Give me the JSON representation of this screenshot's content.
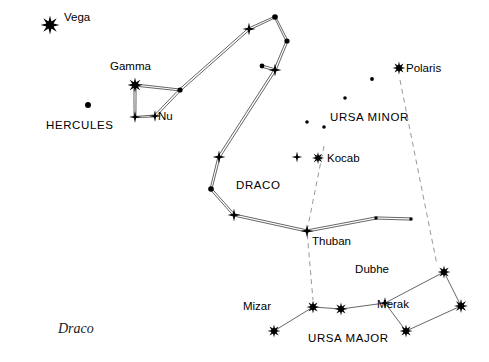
{
  "figure": {
    "caption": "Draco",
    "background_color": "#ffffff",
    "line_color": "#555555",
    "star_color": "#000000",
    "dashed_color": "#999999",
    "width": 489,
    "height": 362
  },
  "labels": [
    {
      "name": "vega-label",
      "text": "Vega",
      "x": 64,
      "y": 20,
      "anchor": "start",
      "kind": "star"
    },
    {
      "name": "gamma-label",
      "text": "Gamma",
      "x": 110,
      "y": 69,
      "anchor": "start",
      "kind": "star"
    },
    {
      "name": "nu-label",
      "text": "Nu",
      "x": 158,
      "y": 119,
      "anchor": "start",
      "kind": "star"
    },
    {
      "name": "hercules-label",
      "text": "HERCULES",
      "x": 46,
      "y": 128,
      "anchor": "start",
      "kind": "constellation"
    },
    {
      "name": "polaris-label",
      "text": "Polaris",
      "x": 406,
      "y": 71,
      "anchor": "start",
      "kind": "star"
    },
    {
      "name": "ursa-minor-label",
      "text": "URSA  MINOR",
      "x": 330,
      "y": 120,
      "anchor": "start",
      "kind": "constellation"
    },
    {
      "name": "kocab-label",
      "text": "Kocab",
      "x": 327,
      "y": 161,
      "anchor": "start",
      "kind": "star"
    },
    {
      "name": "draco-label",
      "text": "DRACO",
      "x": 236,
      "y": 188,
      "anchor": "start",
      "kind": "constellation"
    },
    {
      "name": "thuban-label",
      "text": "Thuban",
      "x": 312,
      "y": 244,
      "anchor": "start",
      "kind": "star"
    },
    {
      "name": "dubhe-label",
      "text": "Dubhe",
      "x": 389,
      "y": 272,
      "anchor": "end",
      "kind": "star"
    },
    {
      "name": "merak-label",
      "text": "Merak",
      "x": 409,
      "y": 307,
      "anchor": "end",
      "kind": "star"
    },
    {
      "name": "mizar-label",
      "text": "Mizar",
      "x": 271,
      "y": 309,
      "anchor": "end",
      "kind": "star"
    },
    {
      "name": "ursa-major-label",
      "text": "URSA  MAJOR",
      "x": 308,
      "y": 341,
      "anchor": "start",
      "kind": "constellation"
    }
  ],
  "chart_data": {
    "type": "scatter",
    "title": "Draco",
    "xlabel": "",
    "ylabel": "",
    "xlim": [
      0,
      489
    ],
    "ylim": [
      0,
      362
    ],
    "grid": false,
    "legend": "none",
    "stars": [
      {
        "id": "vega",
        "label": "Vega",
        "x": 50,
        "y": 25,
        "glyph": "burst8",
        "size": 9.5
      },
      {
        "id": "gamma",
        "label": "Gamma",
        "x": 135,
        "y": 85,
        "glyph": "burst8",
        "size": 7.5
      },
      {
        "id": "d-head-e",
        "label": "",
        "x": 180,
        "y": 90,
        "glyph": "dot",
        "size": 2.6
      },
      {
        "id": "nu",
        "label": "Nu",
        "x": 155,
        "y": 116,
        "glyph": "cross",
        "size": 6.0
      },
      {
        "id": "d-head-s",
        "label": "",
        "x": 135,
        "y": 117,
        "glyph": "cross",
        "size": 6.0
      },
      {
        "id": "herc-dot",
        "label": "HERCULES",
        "x": 88,
        "y": 105,
        "glyph": "dot",
        "size": 3.0
      },
      {
        "id": "d-b1",
        "label": "",
        "x": 249,
        "y": 29,
        "glyph": "cross",
        "size": 6.5
      },
      {
        "id": "d-b2",
        "label": "",
        "x": 275,
        "y": 17,
        "glyph": "dot",
        "size": 2.8
      },
      {
        "id": "d-b3",
        "label": "",
        "x": 287,
        "y": 41,
        "glyph": "dot",
        "size": 2.6
      },
      {
        "id": "d-b4",
        "label": "",
        "x": 275,
        "y": 70,
        "glyph": "cross",
        "size": 6.5
      },
      {
        "id": "d-b4b",
        "label": "",
        "x": 262,
        "y": 66,
        "glyph": "dot",
        "size": 2.4
      },
      {
        "id": "d-b5",
        "label": "",
        "x": 219,
        "y": 157,
        "glyph": "cross",
        "size": 6.5
      },
      {
        "id": "d-b6",
        "label": "",
        "x": 211,
        "y": 189,
        "glyph": "dot",
        "size": 2.8
      },
      {
        "id": "d-b7",
        "label": "",
        "x": 234,
        "y": 215,
        "glyph": "cross",
        "size": 6.5
      },
      {
        "id": "thuban",
        "label": "Thuban",
        "x": 307,
        "y": 231,
        "glyph": "cross",
        "size": 6.5
      },
      {
        "id": "d-tail1",
        "label": "",
        "x": 376,
        "y": 218,
        "glyph": "square",
        "size": 3.0
      },
      {
        "id": "d-tail2",
        "label": "",
        "x": 411,
        "y": 219,
        "glyph": "square",
        "size": 3.0
      },
      {
        "id": "polaris",
        "label": "Polaris",
        "x": 399,
        "y": 68,
        "glyph": "burst8",
        "size": 6.5
      },
      {
        "id": "kocab",
        "label": "Kocab",
        "x": 318,
        "y": 158,
        "glyph": "burst8",
        "size": 6.0
      },
      {
        "id": "um-c",
        "label": "",
        "x": 297,
        "y": 157,
        "glyph": "cross",
        "size": 5.5
      },
      {
        "id": "um-f1",
        "label": "",
        "x": 372,
        "y": 79,
        "glyph": "dot",
        "size": 1.9
      },
      {
        "id": "um-f2",
        "label": "",
        "x": 345,
        "y": 98,
        "glyph": "dot",
        "size": 1.8
      },
      {
        "id": "um-f3",
        "label": "",
        "x": 307,
        "y": 122,
        "glyph": "dot",
        "size": 1.8
      },
      {
        "id": "um-f4",
        "label": "",
        "x": 324,
        "y": 127,
        "glyph": "dot",
        "size": 1.8
      },
      {
        "id": "mizar",
        "label": "Mizar",
        "x": 313,
        "y": 307,
        "glyph": "burst8",
        "size": 6.5
      },
      {
        "id": "alkaid",
        "label": "",
        "x": 274,
        "y": 331,
        "glyph": "burst8",
        "size": 6.5
      },
      {
        "id": "alioth",
        "label": "",
        "x": 341,
        "y": 309,
        "glyph": "burst8",
        "size": 6.5
      },
      {
        "id": "megrez",
        "label": "",
        "x": 385,
        "y": 303,
        "glyph": "cross",
        "size": 6.0
      },
      {
        "id": "phecda",
        "label": "",
        "x": 406,
        "y": 331,
        "glyph": "burst8",
        "size": 6.5
      },
      {
        "id": "merak",
        "label": "Merak",
        "x": 461,
        "y": 306,
        "glyph": "burst8",
        "size": 7.0
      },
      {
        "id": "dubhe",
        "label": "Dubhe",
        "x": 444,
        "y": 272,
        "glyph": "burst8",
        "size": 6.5
      }
    ],
    "constellation_lines": [
      {
        "name": "draco-body",
        "style": "double",
        "points": [
          [
            135,
            85
          ],
          [
            180,
            90
          ],
          [
            249,
            29
          ],
          [
            275,
            17
          ],
          [
            287,
            41
          ],
          [
            275,
            70
          ],
          [
            219,
            157
          ],
          [
            211,
            189
          ],
          [
            234,
            215
          ],
          [
            307,
            231
          ],
          [
            376,
            218
          ],
          [
            411,
            219
          ]
        ]
      },
      {
        "name": "draco-head",
        "style": "double",
        "points": [
          [
            135,
            85
          ],
          [
            135,
            117
          ],
          [
            155,
            116
          ],
          [
            180,
            90
          ]
        ]
      },
      {
        "name": "draco-head-spur",
        "style": "double",
        "points": [
          [
            262,
            66
          ],
          [
            275,
            70
          ]
        ]
      },
      {
        "name": "ursa-major-handle",
        "style": "single",
        "points": [
          [
            274,
            331
          ],
          [
            313,
            307
          ],
          [
            341,
            309
          ],
          [
            385,
            303
          ]
        ]
      },
      {
        "name": "ursa-major-bowl",
        "style": "single",
        "points": [
          [
            385,
            303
          ],
          [
            444,
            272
          ],
          [
            461,
            306
          ],
          [
            406,
            331
          ],
          [
            385,
            303
          ]
        ]
      }
    ],
    "pointer_lines": [
      {
        "name": "kocab-thuban-mizar-pointer",
        "style": "dashed",
        "points": [
          [
            324,
            146
          ],
          [
            307,
            231
          ],
          [
            313,
            300
          ]
        ]
      },
      {
        "name": "polaris-dubhe-pointer",
        "style": "dashed",
        "points": [
          [
            400,
            80
          ],
          [
            437,
            265
          ]
        ]
      }
    ]
  }
}
